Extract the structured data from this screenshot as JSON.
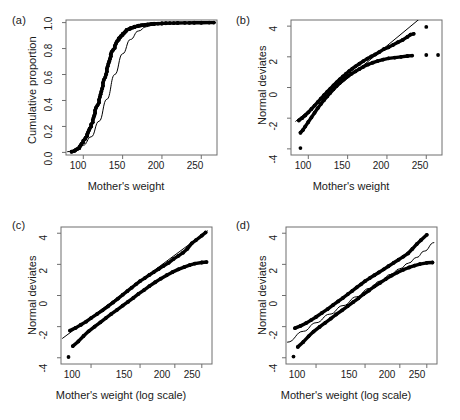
{
  "figure": {
    "panels": [
      {
        "label": "(a)",
        "xlabel": "Mother's weight",
        "ylabel": "Cumulative proportion",
        "xticks": [
          "100",
          "150",
          "200",
          "250"
        ],
        "yticks": [
          "0.0",
          "0.2",
          "0.4",
          "0.6",
          "0.8",
          "1.0"
        ]
      },
      {
        "label": "(b)",
        "xlabel": "Mother's weight",
        "ylabel": "Normal deviates",
        "xticks": [
          "100",
          "150",
          "200",
          "250"
        ],
        "yticks": [
          "-4",
          "-2",
          "0",
          "2",
          "4"
        ]
      },
      {
        "label": "(c)",
        "xlabel": "Mother's weight (log scale)",
        "ylabel": "Normal deviates",
        "xticks": [
          "100",
          "150",
          "200",
          "250"
        ],
        "yticks": [
          "-4",
          "-2",
          "0",
          "2",
          "4"
        ]
      },
      {
        "label": "(d)",
        "xlabel": "Mother's weight (log scale)",
        "ylabel": "Normal deviates",
        "xticks": [
          "100",
          "150",
          "200",
          "250"
        ],
        "yticks": [
          "-4",
          "-2",
          "0",
          "2",
          "4"
        ]
      }
    ]
  },
  "chart_data": [
    {
      "type": "line",
      "panel": "(a)",
      "title": "",
      "xlabel": "Mother's weight",
      "ylabel": "Cumulative proportion",
      "xscale": "linear",
      "xlim": [
        78,
        270
      ],
      "ylim": [
        -0.02,
        1.02
      ],
      "xticks": [
        100,
        150,
        200,
        250
      ],
      "yticks": [
        0.0,
        0.2,
        0.4,
        0.6,
        0.8,
        1.0
      ],
      "grid": false,
      "legend": "none",
      "series": [
        {
          "name": "empirical cumulative proportion",
          "style": "thick-dotted",
          "x": [
            85,
            89,
            90,
            92,
            95,
            95,
            96,
            97,
            98,
            100,
            100,
            102,
            103,
            105,
            105,
            106,
            107,
            108,
            110,
            110,
            112,
            112,
            113,
            114,
            115,
            115,
            116,
            118,
            120,
            120,
            121,
            122,
            123,
            124,
            125,
            125,
            126,
            128,
            129,
            130,
            130,
            131,
            132,
            133,
            134,
            135,
            135,
            136,
            138,
            140,
            140,
            141,
            142,
            143,
            145,
            145,
            147,
            148,
            150,
            150,
            152,
            153,
            154,
            155,
            155,
            158,
            160,
            160,
            163,
            165,
            165,
            168,
            170,
            170,
            173,
            175,
            178,
            180,
            182,
            185,
            187,
            190,
            190,
            195,
            200,
            200,
            205,
            210,
            215,
            220,
            229,
            235,
            241,
            250,
            260,
            266
          ],
          "y": [
            0.005,
            0.012,
            0.018,
            0.025,
            0.033,
            0.041,
            0.049,
            0.058,
            0.068,
            0.079,
            0.09,
            0.102,
            0.114,
            0.127,
            0.14,
            0.154,
            0.168,
            0.183,
            0.199,
            0.215,
            0.232,
            0.249,
            0.267,
            0.285,
            0.304,
            0.323,
            0.343,
            0.363,
            0.384,
            0.405,
            0.426,
            0.448,
            0.47,
            0.492,
            0.514,
            0.536,
            0.558,
            0.58,
            0.602,
            0.623,
            0.644,
            0.664,
            0.684,
            0.703,
            0.722,
            0.74,
            0.757,
            0.774,
            0.79,
            0.805,
            0.819,
            0.832,
            0.845,
            0.857,
            0.868,
            0.878,
            0.888,
            0.897,
            0.905,
            0.913,
            0.92,
            0.927,
            0.933,
            0.939,
            0.944,
            0.949,
            0.954,
            0.958,
            0.962,
            0.965,
            0.968,
            0.971,
            0.974,
            0.976,
            0.978,
            0.98,
            0.982,
            0.984,
            0.986,
            0.987,
            0.989,
            0.99,
            0.991,
            0.992,
            0.993,
            0.994,
            0.995,
            0.996,
            0.996,
            0.997,
            0.998,
            0.998,
            0.999,
            0.999,
            1.0,
            1.0
          ]
        },
        {
          "name": "fitted normal cumulative curve",
          "style": "thin-line",
          "x": [
            80,
            90,
            100,
            110,
            120,
            130,
            140,
            150,
            160,
            170,
            180,
            190,
            200,
            215,
            230,
            250,
            268
          ],
          "y": [
            0.005,
            0.02,
            0.055,
            0.12,
            0.24,
            0.41,
            0.6,
            0.76,
            0.87,
            0.935,
            0.968,
            0.985,
            0.993,
            0.998,
            0.999,
            1.0,
            1.0
          ]
        }
      ]
    },
    {
      "type": "scatter",
      "panel": "(b)",
      "title": "",
      "xlabel": "Mother's weight",
      "ylabel": "Normal deviates",
      "xscale": "linear",
      "xlim": [
        78,
        270
      ],
      "ylim": [
        -4.4,
        4.4
      ],
      "xticks": [
        100,
        150,
        200,
        250
      ],
      "yticks": [
        -4,
        -2,
        0,
        2,
        4
      ],
      "grid": false,
      "legend": "none",
      "series": [
        {
          "name": "upper branch normal deviates",
          "style": "thick-dotted",
          "x": [
            88,
            92,
            96,
            100,
            104,
            108,
            112,
            116,
            120,
            124,
            128,
            132,
            136,
            140,
            144,
            148,
            152,
            156,
            160,
            165,
            170,
            175,
            180,
            185,
            190,
            196,
            202,
            208,
            214,
            220,
            226,
            230,
            234,
            250
          ],
          "y": [
            -2.15,
            -2.0,
            -1.82,
            -1.62,
            -1.4,
            -1.18,
            -0.95,
            -0.72,
            -0.5,
            -0.28,
            -0.07,
            0.14,
            0.34,
            0.53,
            0.72,
            0.9,
            1.07,
            1.23,
            1.38,
            1.55,
            1.72,
            1.88,
            2.02,
            2.15,
            2.3,
            2.5,
            2.62,
            2.78,
            2.95,
            3.1,
            3.3,
            3.45,
            3.5,
            3.95
          ]
        },
        {
          "name": "lower branch normal deviates",
          "style": "thick-dotted",
          "x": [
            90,
            90,
            93,
            96,
            100,
            104,
            108,
            112,
            116,
            120,
            124,
            128,
            132,
            136,
            140,
            145,
            150,
            155,
            160,
            165,
            170,
            176,
            182,
            188,
            195,
            202,
            210,
            218,
            226,
            232,
            250,
            265
          ],
          "y": [
            -3.95,
            -2.95,
            -2.78,
            -2.55,
            -2.25,
            -1.95,
            -1.65,
            -1.35,
            -1.08,
            -0.82,
            -0.58,
            -0.35,
            -0.12,
            0.1,
            0.3,
            0.52,
            0.72,
            0.9,
            1.05,
            1.2,
            1.35,
            1.5,
            1.62,
            1.72,
            1.82,
            1.9,
            1.95,
            2.0,
            2.05,
            2.08,
            2.12,
            2.12
          ]
        },
        {
          "name": "reference straight line",
          "style": "thin-line",
          "x": [
            84,
            268
          ],
          "y": [
            -2.2,
            5.6
          ]
        }
      ]
    },
    {
      "type": "scatter",
      "panel": "(c)",
      "title": "",
      "xlabel": "Mother's weight (log scale)",
      "ylabel": "Normal deviates",
      "xscale": "log",
      "xlim": [
        78,
        272
      ],
      "ylim": [
        -4.4,
        4.4
      ],
      "xticks": [
        100,
        150,
        200,
        250
      ],
      "yticks": [
        -4,
        -2,
        0,
        2,
        4
      ],
      "grid": false,
      "legend": "none",
      "series": [
        {
          "name": "upper branch normal deviates",
          "style": "thick-dotted",
          "x": [
            84,
            88,
            92,
            96,
            100,
            105,
            110,
            115,
            120,
            125,
            130,
            135,
            140,
            145,
            150,
            156,
            162,
            168,
            175,
            182,
            190,
            198,
            206,
            214,
            222,
            230,
            238,
            250,
            258
          ],
          "y": [
            -2.25,
            -2.08,
            -1.88,
            -1.68,
            -1.45,
            -1.2,
            -0.95,
            -0.7,
            -0.45,
            -0.2,
            0.05,
            0.28,
            0.5,
            0.72,
            0.92,
            1.12,
            1.32,
            1.5,
            1.7,
            1.9,
            2.1,
            2.35,
            2.55,
            2.75,
            3.0,
            3.35,
            3.55,
            3.85,
            4.05
          ]
        },
        {
          "name": "lower branch normal deviates",
          "style": "thick-dotted",
          "x": [
            83,
            86,
            90,
            94,
            98,
            103,
            108,
            113,
            118,
            124,
            130,
            136,
            142,
            148,
            155,
            162,
            170,
            178,
            187,
            196,
            206,
            216,
            226,
            236,
            250,
            260
          ],
          "y": [
            -3.95,
            -3.25,
            -2.95,
            -2.6,
            -2.3,
            -2.0,
            -1.72,
            -1.45,
            -1.2,
            -0.92,
            -0.65,
            -0.4,
            -0.15,
            0.1,
            0.35,
            0.6,
            0.85,
            1.08,
            1.3,
            1.5,
            1.68,
            1.82,
            1.95,
            2.05,
            2.12,
            2.15
          ]
        },
        {
          "name": "reference straight line",
          "style": "thin-line",
          "x": [
            79,
            262
          ],
          "y": [
            -2.75,
            4.15
          ]
        }
      ]
    },
    {
      "type": "scatter",
      "panel": "(d)",
      "title": "",
      "xlabel": "Mother's weight (log scale)",
      "ylabel": "Normal deviates",
      "xscale": "log",
      "xlim": [
        78,
        272
      ],
      "ylim": [
        -4.4,
        4.4
      ],
      "xticks": [
        100,
        150,
        200,
        250
      ],
      "yticks": [
        -4,
        -2,
        0,
        2,
        4
      ],
      "grid": false,
      "legend": "none",
      "series": [
        {
          "name": "upper branch normal deviates",
          "style": "thick-dotted",
          "x": [
            84,
            88,
            92,
            96,
            100,
            105,
            110,
            115,
            120,
            125,
            130,
            135,
            140,
            145,
            150,
            156,
            162,
            168,
            175,
            182,
            190,
            198,
            206,
            214,
            222,
            230,
            238,
            250
          ],
          "y": [
            -2.1,
            -1.95,
            -1.78,
            -1.58,
            -1.38,
            -1.12,
            -0.88,
            -0.62,
            -0.38,
            -0.15,
            0.08,
            0.3,
            0.52,
            0.72,
            0.92,
            1.12,
            1.3,
            1.48,
            1.68,
            1.88,
            2.1,
            2.3,
            2.5,
            2.7,
            3.0,
            3.3,
            3.55,
            3.9
          ]
        },
        {
          "name": "lower branch normal deviates",
          "style": "thick-dotted",
          "x": [
            83,
            86,
            90,
            94,
            98,
            103,
            108,
            113,
            118,
            124,
            130,
            136,
            142,
            148,
            155,
            162,
            170,
            178,
            187,
            196,
            206,
            216,
            226,
            236,
            250,
            262
          ],
          "y": [
            -3.92,
            -3.3,
            -2.98,
            -2.62,
            -2.32,
            -2.02,
            -1.75,
            -1.48,
            -1.22,
            -0.95,
            -0.68,
            -0.42,
            -0.18,
            0.08,
            0.32,
            0.58,
            0.82,
            1.05,
            1.28,
            1.48,
            1.66,
            1.8,
            1.92,
            2.02,
            2.1,
            2.12
          ]
        },
        {
          "name": "reference curved line",
          "style": "thin-curve",
          "x": [
            79,
            90,
            100,
            112,
            125,
            140,
            155,
            170,
            185,
            200,
            215,
            230,
            245,
            265
          ],
          "y": [
            -3.0,
            -2.3,
            -1.75,
            -1.2,
            -0.65,
            -0.08,
            0.45,
            0.92,
            1.35,
            1.72,
            2.08,
            2.45,
            2.85,
            3.4
          ]
        }
      ]
    }
  ]
}
